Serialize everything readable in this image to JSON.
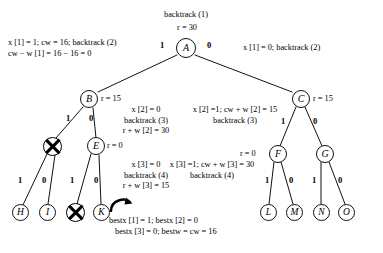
{
  "figure": {
    "type": "backtracking-state-space-tree",
    "width": 383,
    "height": 253,
    "background": "#ffffff",
    "ink": "#000000"
  },
  "nodes": [
    {
      "id": "A",
      "label": "A",
      "x": 186,
      "y": 48,
      "r_text": "r = 30",
      "state": "live"
    },
    {
      "id": "B",
      "label": "B",
      "x": 89,
      "y": 99,
      "r_text": "r = 15",
      "state": "live"
    },
    {
      "id": "C",
      "label": "C",
      "x": 301,
      "y": 99,
      "r_text": "r = 15",
      "state": "live"
    },
    {
      "id": "D",
      "label": "",
      "x": 52,
      "y": 146,
      "r_text": "",
      "state": "dead"
    },
    {
      "id": "E",
      "label": "E",
      "x": 96,
      "y": 146,
      "r_text": "r = 0",
      "state": "live"
    },
    {
      "id": "F",
      "label": "F",
      "x": 278,
      "y": 154,
      "r_text": "r = 0",
      "state": "live"
    },
    {
      "id": "G",
      "label": "G",
      "x": 325,
      "y": 154,
      "r_text": "",
      "state": "live"
    },
    {
      "id": "H",
      "label": "H",
      "x": 20,
      "y": 212,
      "r_text": "",
      "state": "live"
    },
    {
      "id": "I",
      "label": "I",
      "x": 47,
      "y": 212,
      "r_text": "",
      "state": "live"
    },
    {
      "id": "J",
      "label": "",
      "x": 75,
      "y": 212,
      "r_text": "",
      "state": "dead"
    },
    {
      "id": "K",
      "label": "K",
      "x": 101,
      "y": 212,
      "r_text": "",
      "state": "live"
    },
    {
      "id": "L",
      "label": "L",
      "x": 268,
      "y": 212,
      "r_text": "",
      "state": "live"
    },
    {
      "id": "M",
      "label": "M",
      "x": 294,
      "y": 212,
      "r_text": "",
      "state": "live"
    },
    {
      "id": "N",
      "label": "N",
      "x": 321,
      "y": 212,
      "r_text": "",
      "state": "live"
    },
    {
      "id": "O",
      "label": "O",
      "x": 346,
      "y": 212,
      "r_text": "",
      "state": "live"
    }
  ],
  "edges": [
    {
      "from": "A",
      "to": "B",
      "label": "1"
    },
    {
      "from": "A",
      "to": "C",
      "label": "0"
    },
    {
      "from": "B",
      "to": "D",
      "label": "1"
    },
    {
      "from": "B",
      "to": "E",
      "label": "0"
    },
    {
      "from": "D",
      "to": "H",
      "label": "1"
    },
    {
      "from": "D",
      "to": "I",
      "label": "0"
    },
    {
      "from": "E",
      "to": "J",
      "label": "1"
    },
    {
      "from": "E",
      "to": "K",
      "label": "0"
    },
    {
      "from": "C",
      "to": "F",
      "label": "1"
    },
    {
      "from": "C",
      "to": "G",
      "label": "0"
    },
    {
      "from": "F",
      "to": "L",
      "label": "1"
    },
    {
      "from": "F",
      "to": "M",
      "label": "0"
    },
    {
      "from": "G",
      "to": "N",
      "label": "1"
    },
    {
      "from": "G",
      "to": "O",
      "label": "0"
    }
  ],
  "edge_labels": {
    "a_left": "1",
    "a_right": "0",
    "b_left": "1",
    "b_right": "0",
    "d_left": "1",
    "d_right": "0",
    "e_left": "1",
    "e_right": "0",
    "c_left": "1",
    "c_right": "0",
    "f_left": "1",
    "f_right": "0",
    "g_left": "1",
    "g_right": "0"
  },
  "node_r_labels": {
    "A": "r = 30",
    "B": "r = 15",
    "C": "r = 15",
    "E": "r = 0",
    "F": "r = 0"
  },
  "annotations": {
    "root_title": "backtrack (1)",
    "left_branch": {
      "line1": "x [1] = 1; cw = 16; backtrack (2)",
      "line2": "cw − w [1] = 16 − 16 = 0"
    },
    "right_branch": {
      "line1": "x [1] = 0; backtrack (2)"
    },
    "b_children": {
      "line1": "x [2] = 0",
      "line2": "backtrack (3)",
      "line3": "r + w [2] = 30"
    },
    "c_children": {
      "line1": "x [2] =1; cw + w [2] = 15",
      "line2": "backtrack (3)"
    },
    "e_children": {
      "line1": "x [3] = 0",
      "line2": "backtrack (4)",
      "line3": "r + w [3] = 15"
    },
    "f_children": {
      "line1": "x [3] =1; cw + w [3] = 30",
      "line2": "backtrack (4)"
    },
    "best_solution": {
      "line1": "bestx [1] = 1; bestx [2] = 0",
      "line2": "bestx [3] = 0; bestw = cw = 16"
    }
  }
}
